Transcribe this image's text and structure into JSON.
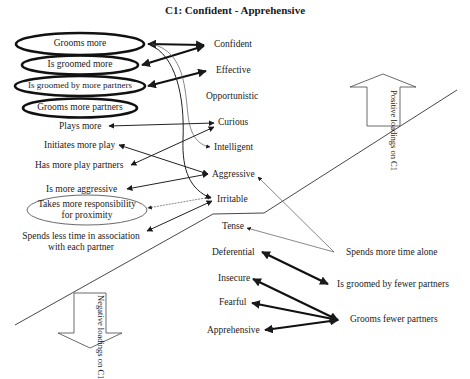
{
  "title": "C1: Confident - Apprehensive",
  "behaviours_positive": [
    {
      "label": "Grooms more",
      "style": "bold-ellipse"
    },
    {
      "label": "Is groomed more",
      "style": "bold-ellipse"
    },
    {
      "label": "Is groomed by more partners",
      "style": "bold-ellipse"
    },
    {
      "label": "Grooms more partners",
      "style": "bold-ellipse"
    },
    {
      "label": "Plays more"
    },
    {
      "label": "Initiates more play"
    },
    {
      "label": "Has more play partners"
    },
    {
      "label": "Is more aggressive"
    },
    {
      "label": "Takes more responsibility for proximity",
      "line1": "Takes more responsibility",
      "line2": "for proximity",
      "style": "thin-ellipse"
    },
    {
      "label": "Spends less time in association with each partner",
      "line1": "Spends less time in association",
      "line2": "with each partner"
    }
  ],
  "traits": [
    "Confident",
    "Effective",
    "Opportunistic",
    "Curious",
    "Intelligent",
    "Aggressive",
    "Irritable",
    "Tense",
    "Deferential",
    "Insecure",
    "Fearful",
    "Apprehensive"
  ],
  "behaviours_negative": [
    "Spends more time alone",
    "Is groomed by fewer partners",
    "Grooms fewer partners"
  ],
  "arrows": {
    "positive": {
      "line1": "Positive",
      "line2": "loadings",
      "line3": "on C1"
    },
    "negative": {
      "line1": "Negative",
      "line2": "loadings",
      "line3": "on C1"
    }
  },
  "links": [
    {
      "from": "Grooms more",
      "to": "Confident",
      "weight": "bold"
    },
    {
      "from": "Is groomed more",
      "to": "Confident",
      "weight": "bold"
    },
    {
      "from": "Is groomed by more partners",
      "to": "Effective",
      "weight": "bold"
    },
    {
      "from": "Grooms more",
      "to": "Intelligent",
      "weight": "thin",
      "shape": "curve"
    },
    {
      "from": "Grooms more",
      "to": "Irritable",
      "weight": "medium",
      "shape": "curve"
    },
    {
      "from": "Plays more",
      "to": "Curious",
      "weight": "medium"
    },
    {
      "from": "Has more play partners",
      "to": "Curious",
      "weight": "medium"
    },
    {
      "from": "Initiates more play",
      "to": "Aggressive",
      "weight": "medium"
    },
    {
      "from": "Is more aggressive",
      "to": "Aggressive",
      "weight": "medium"
    },
    {
      "from": "Takes more responsibility for proximity",
      "to": "Irritable",
      "weight": "thin",
      "style": "dotted"
    },
    {
      "from": "Spends less time in association with each partner",
      "to": "Irritable",
      "weight": "medium"
    },
    {
      "from": "Spends more time alone",
      "to": "Aggressive",
      "weight": "thin"
    },
    {
      "from": "Spends more time alone",
      "to": "Tense",
      "weight": "thin"
    },
    {
      "from": "Is groomed by fewer partners",
      "to": "Deferential",
      "weight": "bold"
    },
    {
      "from": "Grooms fewer partners",
      "to": "Insecure",
      "weight": "bold"
    },
    {
      "from": "Grooms fewer partners",
      "to": "Fearful",
      "weight": "bold"
    },
    {
      "from": "Grooms fewer partners",
      "to": "Apprehensive",
      "weight": "bold"
    }
  ]
}
